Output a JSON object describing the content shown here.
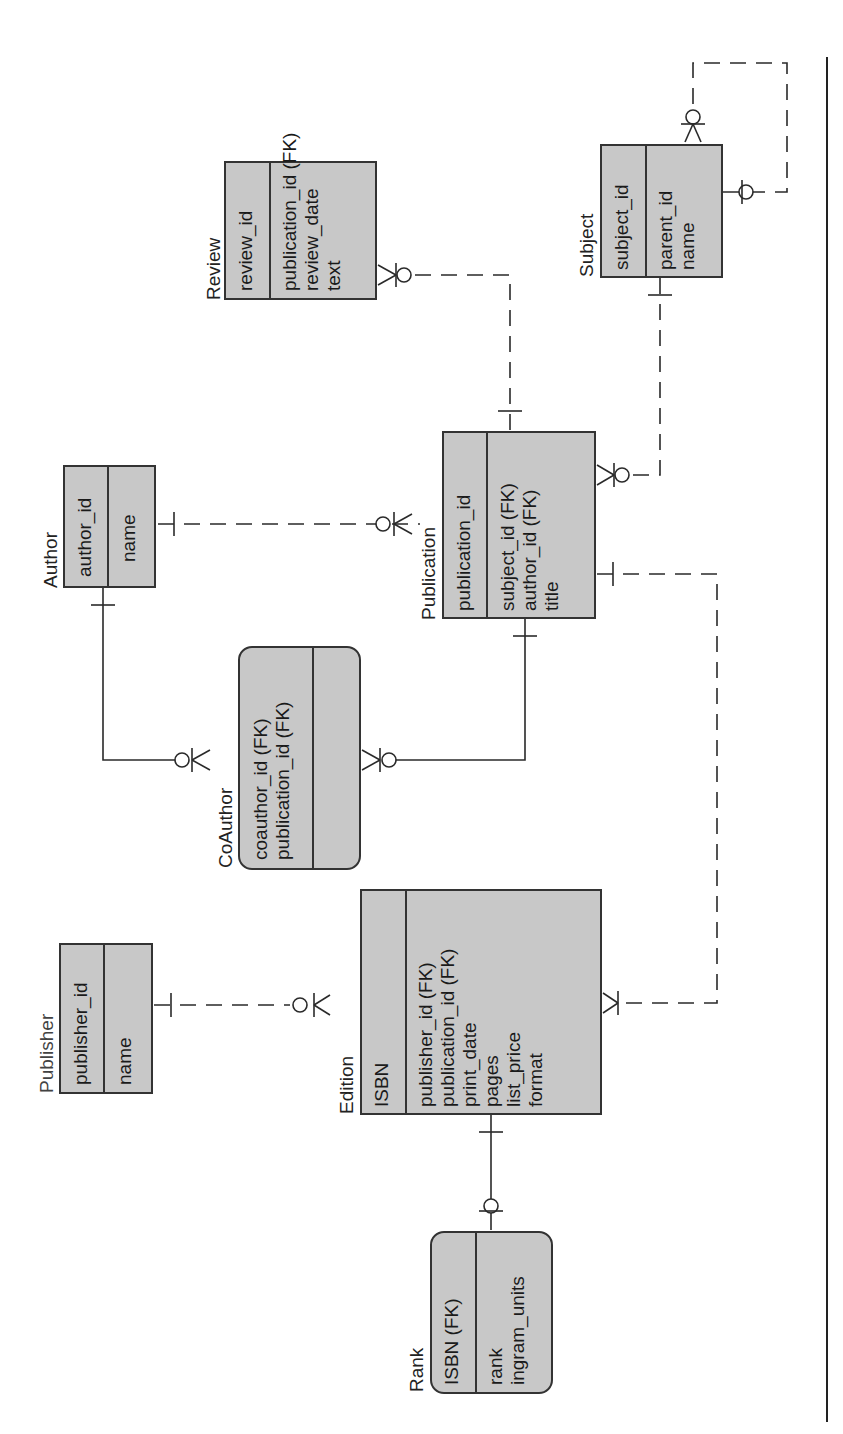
{
  "diagram": {
    "type": "entity-relationship",
    "orientation": "rotated-90-ccw",
    "entities": [
      {
        "name": "Review",
        "keys": [
          "review_id"
        ],
        "attributes": [
          "publication_id (FK)",
          "review_date",
          "text"
        ]
      },
      {
        "name": "Subject",
        "keys": [
          "subject_id"
        ],
        "attributes": [
          "parent_id",
          "name"
        ]
      },
      {
        "name": "Author",
        "keys": [
          "author_id"
        ],
        "attributes": [
          "name"
        ]
      },
      {
        "name": "Publication",
        "keys": [
          "publication_id"
        ],
        "attributes": [
          "subject_id (FK)",
          "author_id (FK)",
          "title"
        ]
      },
      {
        "name": "CoAuthor",
        "keys": [
          "coauthor_id (FK)",
          "publication_id (FK)"
        ],
        "attributes": []
      },
      {
        "name": "Publisher",
        "keys": [
          "publisher_id"
        ],
        "attributes": [
          "name"
        ]
      },
      {
        "name": "Edition",
        "keys": [
          "ISBN"
        ],
        "attributes": [
          "publisher_id (FK)",
          "publication_id (FK)",
          "print_date",
          "pages",
          "list_price",
          "format"
        ]
      },
      {
        "name": "Rank",
        "keys": [
          "ISBN (FK)"
        ],
        "attributes": [
          "rank",
          "ingram_units"
        ]
      }
    ],
    "relationships": [
      {
        "from": "Publication",
        "to": "Review",
        "style": "dashed",
        "from_card": "one",
        "to_card": "zero-or-many"
      },
      {
        "from": "Subject",
        "to": "Publication",
        "style": "dashed",
        "from_card": "one",
        "to_card": "zero-or-many"
      },
      {
        "from": "Subject",
        "to": "Subject",
        "style": "dashed",
        "from_card": "zero-or-one",
        "to_card": "zero-or-many"
      },
      {
        "from": "Author",
        "to": "Publication",
        "style": "dashed",
        "from_card": "one",
        "to_card": "zero-or-many"
      },
      {
        "from": "Author",
        "to": "CoAuthor",
        "style": "solid",
        "from_card": "one",
        "to_card": "zero-or-many"
      },
      {
        "from": "Publication",
        "to": "CoAuthor",
        "style": "solid",
        "from_card": "one",
        "to_card": "zero-or-many"
      },
      {
        "from": "Publisher",
        "to": "Edition",
        "style": "dashed",
        "from_card": "one",
        "to_card": "zero-or-many"
      },
      {
        "from": "Publication",
        "to": "Edition",
        "style": "dashed",
        "from_card": "one",
        "to_card": "one-or-many"
      },
      {
        "from": "Edition",
        "to": "Rank",
        "style": "solid",
        "from_card": "one",
        "to_card": "zero-or-one"
      }
    ]
  }
}
